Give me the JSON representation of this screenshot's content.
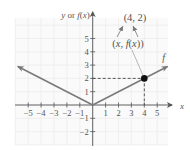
{
  "chart_data": {
    "type": "line",
    "title": "",
    "xlabel": "x",
    "ylabel": "y or f(x)",
    "function_label": "f",
    "function": "f(x) = |x| / 2",
    "series": [
      {
        "name": "f",
        "x": [
          -5.8,
          0,
          5.8
        ],
        "y": [
          2.9,
          0,
          2.9
        ],
        "arrows_on_ends": true
      }
    ],
    "highlight_point": {
      "x": 4,
      "y": 2,
      "label": "(4, 2)",
      "generic_label": "(x, f(x))",
      "dashed_guides": true
    },
    "x_ticks": [
      -5,
      -4,
      -3,
      -2,
      -1,
      1,
      2,
      3,
      4,
      5
    ],
    "y_ticks": [
      -2,
      -1,
      1,
      2,
      3,
      4,
      5
    ],
    "x_tick_labels": [
      "−5",
      "−4",
      "−3",
      "−2",
      "−1",
      "1",
      "2",
      "3",
      "4",
      "5"
    ],
    "y_tick_labels": [
      "−2",
      "−1",
      "1",
      "2",
      "3",
      "4",
      "5"
    ],
    "xlim": [
      -6,
      6
    ],
    "ylim": [
      -3,
      6.5
    ],
    "grid": true,
    "colors": {
      "curve": "#7a7a7a",
      "axis": "#555555",
      "grid": "#ececec",
      "point": "#111111",
      "text": "#555555"
    }
  }
}
